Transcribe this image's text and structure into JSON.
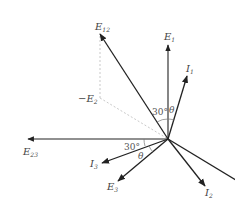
{
  "diagram": {
    "type": "phasor-diagram",
    "colors": {
      "vector": "#222222",
      "dashed": "#bbbbbb",
      "text": "#444444"
    },
    "vectors": [
      {
        "id": "E1",
        "label": "E",
        "subscript": "1",
        "has_arrow": true
      },
      {
        "id": "I1",
        "label": "I",
        "subscript": "1",
        "has_arrow": true
      },
      {
        "id": "E12",
        "label": "E",
        "subscript": "12",
        "has_arrow": true
      },
      {
        "id": "E23",
        "label": "E",
        "subscript": "23",
        "has_arrow": true
      },
      {
        "id": "I3",
        "label": "I",
        "subscript": "3",
        "has_arrow": true
      },
      {
        "id": "E3",
        "label": "E",
        "subscript": "3",
        "has_arrow": true
      },
      {
        "id": "I2",
        "label": "I",
        "subscript": "2",
        "has_arrow": true
      },
      {
        "id": "E2",
        "label": "",
        "subscript": "",
        "has_arrow": false
      }
    ],
    "construction": {
      "label_prefix": "−E",
      "subscript": "2"
    },
    "angles": {
      "upper_30": "30°",
      "upper_theta": "θ",
      "lower_30": "30°",
      "lower_theta": "θ"
    }
  }
}
